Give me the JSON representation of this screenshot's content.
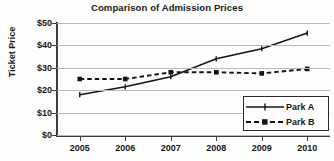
{
  "chart_data": {
    "type": "line",
    "title": "Comparison of Admission Prices",
    "xlabel": "",
    "ylabel": "Ticket Price",
    "x": [
      2005,
      2006,
      2007,
      2008,
      2009,
      2010
    ],
    "categories": [
      "2005",
      "2006",
      "2007",
      "2008",
      "2009",
      "2010"
    ],
    "series": [
      {
        "name": "Park A",
        "values": [
          18,
          21.5,
          26,
          34,
          38.5,
          45.5
        ],
        "style": "solid",
        "marker": "plus",
        "color": "#141414"
      },
      {
        "name": "Park B",
        "values": [
          25,
          25,
          28,
          28,
          27.5,
          29.5
        ],
        "style": "dashed",
        "marker": "square",
        "color": "#141414"
      }
    ],
    "ylim": [
      0,
      50
    ],
    "ytick_values": [
      0,
      10,
      20,
      30,
      40,
      50
    ],
    "ytick_labels": [
      "$0",
      "$10",
      "$20",
      "$30",
      "$40",
      "$50"
    ],
    "xtick_labels": [
      "2005",
      "2006",
      "2007",
      "2008",
      "2009",
      "2010"
    ],
    "grid": true,
    "grid_axis": "y",
    "legend_position": "bottom-right",
    "legend_entries": [
      "Park A",
      "Park B"
    ]
  },
  "legend": {
    "park_a_label": "Park A",
    "park_b_label": "Park B"
  },
  "colors": {
    "grid": "#b9b9b9",
    "axis": "#3c3c3c",
    "text": "#151515",
    "series": "#141414",
    "background": "#fdfdfc"
  }
}
